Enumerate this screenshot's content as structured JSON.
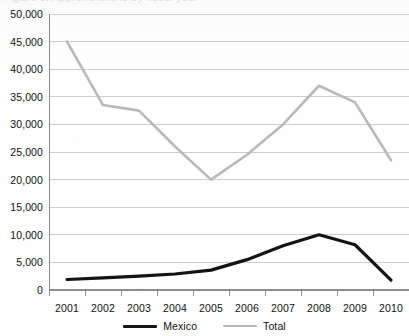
{
  "title_remnant": "Figure 3. Apprehensions by fiscal year",
  "chart_data": {
    "type": "line",
    "title": "",
    "xlabel": "",
    "ylabel": "",
    "categories": [
      "2001",
      "2002",
      "2003",
      "2004",
      "2005",
      "2006",
      "2007",
      "2008",
      "2009",
      "2010"
    ],
    "ylim": [
      0,
      50000
    ],
    "ytick_values": [
      0,
      5000,
      10000,
      15000,
      20000,
      25000,
      30000,
      35000,
      40000,
      45000,
      50000
    ],
    "ytick_labels": [
      "0",
      "5,000",
      "10,000",
      "15,000",
      "20,000",
      "25,000",
      "30,000",
      "35,000",
      "40,000",
      "45,000",
      "50,000"
    ],
    "grid": true,
    "legend_position": "bottom-center",
    "series": [
      {
        "name": "Mexico",
        "color": "#141414",
        "line_width": 3.2,
        "values": [
          1900,
          2200,
          2500,
          2900,
          3600,
          5500,
          8000,
          10000,
          8200,
          1800
        ]
      },
      {
        "name": "Total",
        "color": "#b9b9b9",
        "line_width": 2.6,
        "values": [
          45000,
          33500,
          32500,
          26000,
          20000,
          24500,
          30000,
          37000,
          34000,
          23500
        ]
      }
    ]
  },
  "axis": {
    "axis_color": "#8c8c8c",
    "grid_color": "#c8c8c8",
    "tick_color": "#8c8c8c"
  },
  "legend": {
    "items": [
      {
        "label": "Mexico"
      },
      {
        "label": "Total"
      }
    ]
  }
}
